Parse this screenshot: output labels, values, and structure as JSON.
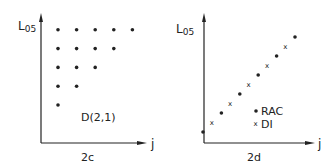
{
  "chart_data": [
    {
      "type": "scatter",
      "panel_label": "2c",
      "ylabel": "L",
      "ylabel_subscript": "05",
      "xlabel": "j",
      "annotation": "D(2,1)",
      "grid": false,
      "legend": null,
      "xlim": [
        0,
        6
      ],
      "ylim": [
        0,
        6
      ],
      "series": [
        {
          "name": "D(2,1) points",
          "marker": "dot",
          "points": [
            [
              1,
              5
            ],
            [
              2,
              5
            ],
            [
              3,
              5
            ],
            [
              4,
              5
            ],
            [
              5,
              5
            ],
            [
              1,
              4
            ],
            [
              2,
              4
            ],
            [
              3,
              4
            ],
            [
              4,
              4
            ],
            [
              1,
              3
            ],
            [
              2,
              3
            ],
            [
              3,
              3
            ],
            [
              1,
              2
            ],
            [
              2,
              2
            ],
            [
              1,
              1
            ]
          ]
        }
      ]
    },
    {
      "type": "scatter",
      "panel_label": "2d",
      "ylabel": "L",
      "ylabel_subscript": "05",
      "xlabel": "j",
      "grid": false,
      "legend": "lower-right",
      "xlim": [
        0,
        11
      ],
      "ylim": [
        0,
        11
      ],
      "series": [
        {
          "name": "RAC",
          "marker": "dot",
          "points": [
            [
              0,
              1
            ],
            [
              2,
              3
            ],
            [
              4,
              5
            ],
            [
              6,
              7
            ],
            [
              8,
              9
            ],
            [
              10,
              11
            ]
          ]
        },
        {
          "name": "DI",
          "marker": "x",
          "points": [
            [
              1,
              2
            ],
            [
              3,
              4
            ],
            [
              5,
              6
            ],
            [
              7,
              8
            ],
            [
              9,
              10
            ]
          ]
        }
      ]
    }
  ]
}
